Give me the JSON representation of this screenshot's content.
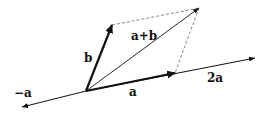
{
  "diagram": {
    "type": "vector-addition-parallelogram",
    "origin": [
      86,
      91
    ],
    "vectors": [
      {
        "name": "a",
        "label": "a",
        "from": [
          86,
          91
        ],
        "to": [
          175,
          73
        ],
        "style": "thick"
      },
      {
        "name": "b",
        "label": "b",
        "from": [
          86,
          91
        ],
        "to": [
          112,
          25
        ],
        "style": "thick"
      },
      {
        "name": "a+b",
        "label": "a+b",
        "from": [
          86,
          91
        ],
        "to": [
          199,
          8
        ],
        "style": "thin"
      },
      {
        "name": "2a",
        "label": "2a",
        "from": [
          175,
          73
        ],
        "to": [
          255,
          58
        ],
        "style": "thin"
      },
      {
        "name": "-a",
        "label": "−a",
        "from": [
          86,
          91
        ],
        "to": [
          20,
          107
        ],
        "style": "thin"
      }
    ],
    "dashed_lines": [
      {
        "from": [
          112,
          25
        ],
        "to": [
          199,
          8
        ]
      },
      {
        "from": [
          199,
          8
        ],
        "to": [
          175,
          73
        ]
      }
    ],
    "labels": {
      "a": "a",
      "b": "b",
      "a_plus_b": "a+b",
      "two_a": "2a",
      "neg_a": "−a"
    },
    "colors": {
      "stroke": "#111111",
      "dashed": "#888888",
      "background": "#ffffff"
    }
  }
}
